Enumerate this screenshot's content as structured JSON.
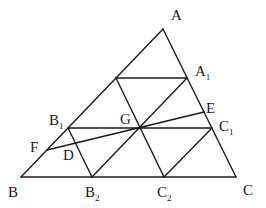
{
  "diagram": {
    "type": "geometry",
    "points": {
      "A": {
        "x": 163,
        "y": 29
      },
      "B": {
        "x": 21,
        "y": 177
      },
      "C": {
        "x": 236,
        "y": 177
      },
      "P": {
        "x": 116,
        "y": 78
      },
      "A1": {
        "x": 187,
        "y": 78
      },
      "B1": {
        "x": 68,
        "y": 128
      },
      "C1": {
        "x": 212,
        "y": 128
      },
      "G": {
        "x": 140,
        "y": 128
      },
      "B2": {
        "x": 92,
        "y": 177
      },
      "C2": {
        "x": 164,
        "y": 177
      },
      "E": {
        "x": 204,
        "y": 112
      },
      "F": {
        "x": 47,
        "y": 150
      },
      "D": {
        "x": 75,
        "y": 143
      }
    },
    "labels": {
      "A": {
        "main": "A",
        "sub": ""
      },
      "A1": {
        "main": "A",
        "sub": "1"
      },
      "E": {
        "main": "E",
        "sub": ""
      },
      "B1": {
        "main": "B",
        "sub": "1"
      },
      "G": {
        "main": "G",
        "sub": ""
      },
      "C1": {
        "main": "C",
        "sub": "1"
      },
      "F": {
        "main": "F",
        "sub": ""
      },
      "D": {
        "main": "D",
        "sub": ""
      },
      "B": {
        "main": "B",
        "sub": ""
      },
      "B2": {
        "main": "B",
        "sub": "2"
      },
      "C2": {
        "main": "C",
        "sub": "2"
      },
      "C": {
        "main": "C",
        "sub": ""
      }
    },
    "segments": [
      [
        "A",
        "B"
      ],
      [
        "B",
        "C"
      ],
      [
        "C",
        "A"
      ],
      [
        "P",
        "A1"
      ],
      [
        "B1",
        "C1"
      ],
      [
        "P",
        "C2"
      ],
      [
        "B1",
        "B2"
      ],
      [
        "A1",
        "B2"
      ],
      [
        "C1",
        "C2"
      ],
      [
        "F",
        "E"
      ]
    ]
  }
}
